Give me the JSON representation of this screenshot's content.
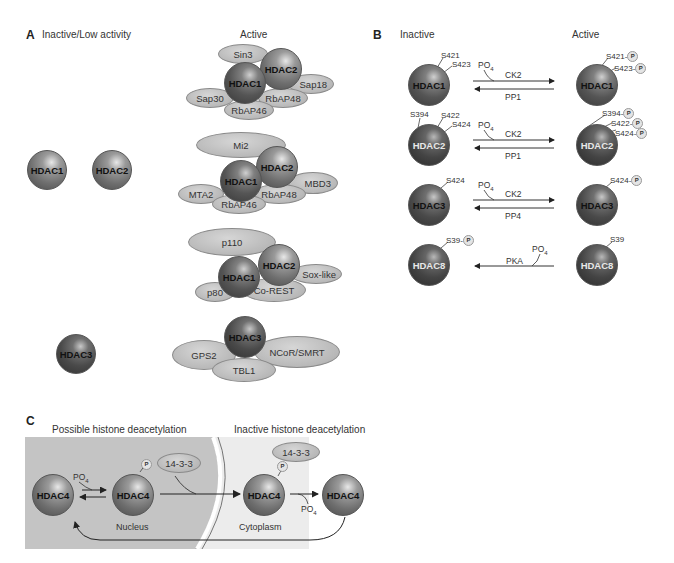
{
  "panel_a": {
    "letter": "A",
    "inactive_header": "Inactive/Low activity",
    "active_header": "Active",
    "inactive": [
      "HDAC1",
      "HDAC2",
      "HDAC3"
    ],
    "complexes": [
      {
        "name": "Sin3 complex",
        "core": [
          "HDAC1",
          "HDAC2"
        ],
        "partners": [
          "Sin3",
          "Sap18",
          "Sap30",
          "RbAP48",
          "RbAP46"
        ]
      },
      {
        "name": "Mi2/NuRD complex",
        "core": [
          "HDAC1",
          "HDAC2"
        ],
        "partners": [
          "Mi2",
          "MBD3",
          "MTA2",
          "RbAP48",
          "RbAP46"
        ]
      },
      {
        "name": "CoREST complex",
        "core": [
          "HDAC1",
          "HDAC2"
        ],
        "partners": [
          "p110",
          "Sox-like",
          "p80",
          "Co-REST"
        ]
      },
      {
        "name": "NCoR/SMRT complex",
        "core": [
          "HDAC3"
        ],
        "partners": [
          "GPS2",
          "NCoR/SMRT",
          "TBL1"
        ]
      }
    ]
  },
  "panel_b": {
    "letter": "B",
    "inactive_header": "Inactive",
    "active_header": "Active",
    "p_label": "P",
    "rows": [
      {
        "enzyme": "HDAC1",
        "inactive_sites": [
          "S421",
          "S423"
        ],
        "active_sites": [
          "S421-",
          "S423-"
        ],
        "forward": "CK2",
        "reverse": "PP1",
        "po4": "PO",
        "po4_sub": "4"
      },
      {
        "enzyme": "HDAC2",
        "inactive_sites": [
          "S394",
          "S422",
          "S424"
        ],
        "active_sites": [
          "S394-",
          "S422-",
          "S424-"
        ],
        "forward": "CK2",
        "reverse": "PP1",
        "po4": "PO",
        "po4_sub": "4"
      },
      {
        "enzyme": "HDAC3",
        "inactive_sites": [
          "S424"
        ],
        "active_sites": [
          "S424-"
        ],
        "forward": "CK2",
        "reverse": "PP4",
        "po4": "PO",
        "po4_sub": "4"
      },
      {
        "enzyme": "HDAC8",
        "inactive_sites": [
          "S39-"
        ],
        "active_sites": [
          "S39"
        ],
        "forward": "",
        "reverse": "PKA",
        "po4": "PO",
        "po4_sub": "4"
      }
    ]
  },
  "panel_c": {
    "letter": "C",
    "left_header": "Possible histone deacetylation",
    "right_header": "Inactive histone deacetylation",
    "nucleus_label": "Nucleus",
    "cytoplasm_label": "Cytoplasm",
    "enzyme": "HDAC4",
    "adaptor": "14-3-3",
    "po4": "PO",
    "po4_sub": "4",
    "p_label": "P"
  },
  "colors": {
    "nucleus_bg": "#c4c4c4",
    "cytoplasm_bg": "#ececec",
    "partner_fill": "#bdbdbd",
    "sphere_dark": "#4a4a4a"
  }
}
